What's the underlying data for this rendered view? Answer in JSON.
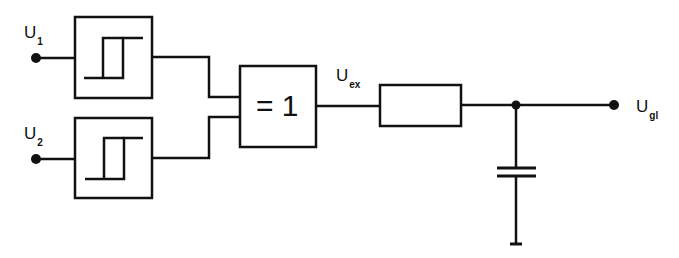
{
  "diagram": {
    "type": "circuit",
    "labels": {
      "u1": {
        "main": "U",
        "sub": "1"
      },
      "u2": {
        "main": "U",
        "sub": "2"
      },
      "uex": {
        "main": "U",
        "sub": "ex"
      },
      "ugl": {
        "main": "U",
        "sub": "gl"
      }
    },
    "gate_label": "= 1",
    "components": [
      "schmitt-trigger-1",
      "schmitt-trigger-2",
      "xor-gate",
      "resistor",
      "capacitor",
      "ground"
    ],
    "stroke_color": "#111111"
  }
}
